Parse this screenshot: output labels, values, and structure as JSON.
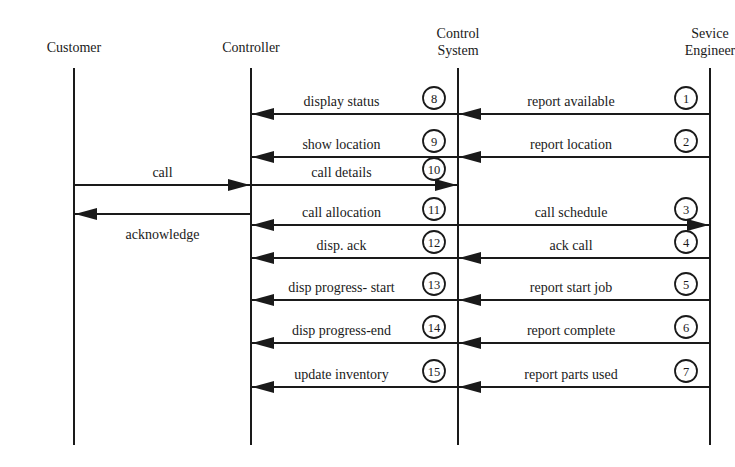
{
  "diagram": {
    "type": "sequence-diagram",
    "actors": [
      {
        "id": "customer",
        "label_lines": [
          "Customer"
        ],
        "x": 74
      },
      {
        "id": "controller",
        "label_lines": [
          "Controller"
        ],
        "x": 251
      },
      {
        "id": "control_system",
        "label_lines": [
          "Control",
          "System"
        ],
        "x": 458
      },
      {
        "id": "service_engineer",
        "label_lines": [
          "Sevice",
          "Engineer"
        ],
        "x": 710
      }
    ],
    "lifeline_top": 68,
    "lifeline_bottom": 445,
    "messages": [
      {
        "num": "1",
        "label": "report available",
        "from": "service_engineer",
        "to": "control_system",
        "y": 114
      },
      {
        "num": "2",
        "label": "report location",
        "from": "service_engineer",
        "to": "control_system",
        "y": 157
      },
      {
        "num": "3",
        "label": "call schedule",
        "from": "control_system",
        "to": "service_engineer",
        "y": 225
      },
      {
        "num": "4",
        "label": "ack call",
        "from": "service_engineer",
        "to": "control_system",
        "y": 258
      },
      {
        "num": "5",
        "label": "report start job",
        "from": "service_engineer",
        "to": "control_system",
        "y": 300
      },
      {
        "num": "6",
        "label": "report complete",
        "from": "service_engineer",
        "to": "control_system",
        "y": 343
      },
      {
        "num": "7",
        "label": "report parts used",
        "from": "service_engineer",
        "to": "control_system",
        "y": 387
      },
      {
        "num": "8",
        "label": "display status",
        "from": "control_system",
        "to": "controller",
        "y": 114
      },
      {
        "num": "9",
        "label": "show location",
        "from": "control_system",
        "to": "controller",
        "y": 157
      },
      {
        "num": "10",
        "label": "call details",
        "from": "controller",
        "to": "control_system",
        "y": 185
      },
      {
        "num": "11",
        "label": "call allocation",
        "from": "control_system",
        "to": "controller",
        "y": 225
      },
      {
        "num": "12",
        "label": "disp. ack",
        "from": "control_system",
        "to": "controller",
        "y": 258
      },
      {
        "num": "13",
        "label": "disp progress- start",
        "from": "control_system",
        "to": "controller",
        "y": 300
      },
      {
        "num": "14",
        "label": "disp progress-end",
        "from": "control_system",
        "to": "controller",
        "y": 343
      },
      {
        "num": "15",
        "label": "update inventory",
        "from": "control_system",
        "to": "controller",
        "y": 387
      },
      {
        "num": "",
        "label": "call",
        "from": "customer",
        "to": "controller",
        "y": 185
      },
      {
        "num": "",
        "label": "acknowledge",
        "from": "controller",
        "to": "customer",
        "y": 214,
        "label_below": true
      }
    ]
  }
}
